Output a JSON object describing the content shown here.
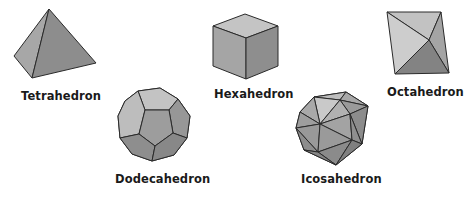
{
  "figure": {
    "solids": [
      {
        "name": "Tetrahedron",
        "faces": 4
      },
      {
        "name": "Hexahedron",
        "faces": 6
      },
      {
        "name": "Octahedron",
        "faces": 8
      },
      {
        "name": "Dodecahedron",
        "faces": 12
      },
      {
        "name": "Icosahedron",
        "faces": 20
      }
    ]
  },
  "colors": {
    "light": "#c9c9c9",
    "mid": "#a3a3a3",
    "dark": "#8a8a8a",
    "darker": "#7a7a7a",
    "edge": "#2a2a2a"
  }
}
